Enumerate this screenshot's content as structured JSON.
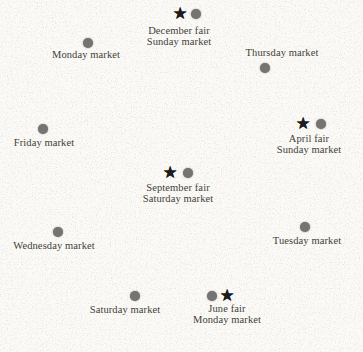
{
  "figure": {
    "name": "markets-and-fairs-map",
    "colors": {
      "background": "#fbfaf7",
      "speckle": "#94918a",
      "dot": "#767472",
      "star": "#1c1c1c",
      "text": "#433f38"
    },
    "locations": [
      {
        "name": "december-fair",
        "symbols": [
          {
            "type": "star",
            "x": 180,
            "y": 13
          },
          {
            "type": "dot",
            "x": 196,
            "y": 14
          }
        ],
        "label": {
          "lines": [
            "December fair",
            "Sunday market"
          ],
          "x": 179,
          "y": 26
        }
      },
      {
        "name": "monday-market",
        "symbols": [
          {
            "type": "dot",
            "x": 88,
            "y": 43
          }
        ],
        "label": {
          "lines": [
            "Monday market"
          ],
          "x": 86,
          "y": 50
        }
      },
      {
        "name": "thursday-market",
        "symbols": [
          {
            "type": "dot",
            "x": 265,
            "y": 68
          }
        ],
        "label": {
          "lines": [
            "Thursday market"
          ],
          "x": 282,
          "y": 48
        }
      },
      {
        "name": "april-fair",
        "symbols": [
          {
            "type": "star",
            "x": 303,
            "y": 123
          },
          {
            "type": "dot",
            "x": 321,
            "y": 124
          }
        ],
        "label": {
          "lines": [
            "April fair",
            "Sunday market"
          ],
          "x": 309,
          "y": 134
        }
      },
      {
        "name": "friday-market",
        "symbols": [
          {
            "type": "dot",
            "x": 43,
            "y": 129
          }
        ],
        "label": {
          "lines": [
            "Friday market"
          ],
          "x": 44,
          "y": 138
        }
      },
      {
        "name": "september-fair",
        "symbols": [
          {
            "type": "star",
            "x": 170,
            "y": 172
          },
          {
            "type": "dot",
            "x": 188,
            "y": 173
          }
        ],
        "label": {
          "lines": [
            "September fair",
            "Saturday market"
          ],
          "x": 178,
          "y": 183
        }
      },
      {
        "name": "wednesday-market",
        "symbols": [
          {
            "type": "dot",
            "x": 58,
            "y": 232
          }
        ],
        "label": {
          "lines": [
            "Wednesday market"
          ],
          "x": 54,
          "y": 241
        }
      },
      {
        "name": "tuesday-market",
        "symbols": [
          {
            "type": "dot",
            "x": 305,
            "y": 227
          }
        ],
        "label": {
          "lines": [
            "Tuesday market"
          ],
          "x": 307,
          "y": 236
        }
      },
      {
        "name": "saturday-market",
        "symbols": [
          {
            "type": "dot",
            "x": 135,
            "y": 296
          }
        ],
        "label": {
          "lines": [
            "Saturday market"
          ],
          "x": 125,
          "y": 305
        }
      },
      {
        "name": "june-fair",
        "symbols": [
          {
            "type": "dot",
            "x": 212,
            "y": 296
          },
          {
            "type": "star",
            "x": 227,
            "y": 295
          }
        ],
        "label": {
          "lines": [
            "June fair",
            "Monday market"
          ],
          "x": 227,
          "y": 304
        }
      }
    ]
  }
}
